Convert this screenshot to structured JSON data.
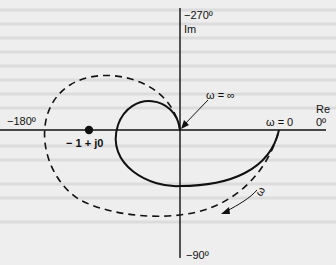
{
  "diagram": {
    "type": "nyquist-plot",
    "axes": {
      "real_label": "Re",
      "imag_label": "Im",
      "top_angle": "−270º",
      "bottom_angle": "−90º",
      "left_angle": "−180º",
      "right_angle": "0º"
    },
    "annotations": {
      "critical_point": "− 1 + j0",
      "omega_infinity": "ω = ∞",
      "omega_zero": "ω = 0",
      "omega_direction": "ω"
    },
    "curves": [
      {
        "name": "solid-locus",
        "style": "solid"
      },
      {
        "name": "dashed-locus",
        "style": "dashed"
      }
    ],
    "colors": {
      "background": "#eeeeee",
      "ink": "#111111",
      "faint_text": "#d8d8d8"
    }
  }
}
